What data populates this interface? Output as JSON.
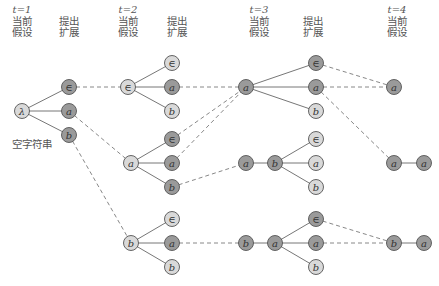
{
  "colors": {
    "node_light": "#d9d9d9",
    "node_dark": "#9a9a9a",
    "stroke": "#555555",
    "edge": "#777777",
    "dashed": "#888888"
  },
  "columns": [
    {
      "time_label": "t=1",
      "x": 22,
      "header": "当前\n假设",
      "header_line1": "当前",
      "header_line2": "假设"
    },
    {
      "x": 69,
      "header_line1": "提出",
      "header_line2": "扩展"
    },
    {
      "time_label": "t=2",
      "x": 128,
      "header_line1": "当前",
      "header_line2": "假设"
    },
    {
      "x": 172,
      "header_line1": "提出",
      "header_line2": "扩展"
    },
    {
      "time_label": "t=3",
      "x": 246,
      "header_line1": "当前",
      "header_line2": "假设"
    },
    {
      "x": 316,
      "header_line1": "提出",
      "header_line2": "扩展"
    },
    {
      "time_label": "t=4",
      "x": 394,
      "header_line1": "当前",
      "header_line2": "假设"
    }
  ],
  "annotation": "空字符串",
  "nodes": [
    {
      "id": "t1_root",
      "label": "λ",
      "x": 22,
      "y": 111,
      "shade": "light"
    },
    {
      "id": "t1_e",
      "label": "∈",
      "x": 69,
      "y": 87,
      "shade": "dark"
    },
    {
      "id": "t1_a",
      "label": "a",
      "x": 69,
      "y": 111,
      "shade": "dark"
    },
    {
      "id": "t1_b",
      "label": "b",
      "x": 69,
      "y": 135,
      "shade": "dark"
    },
    {
      "id": "t2A_root",
      "label": "∈",
      "x": 128,
      "y": 87,
      "shade": "light"
    },
    {
      "id": "t2A_e",
      "label": "∈",
      "x": 172,
      "y": 63,
      "shade": "light"
    },
    {
      "id": "t2A_a",
      "label": "a",
      "x": 172,
      "y": 87,
      "shade": "dark"
    },
    {
      "id": "t2A_b",
      "label": "b",
      "x": 172,
      "y": 111,
      "shade": "light"
    },
    {
      "id": "t2B_root",
      "label": "a",
      "x": 131,
      "y": 163,
      "shade": "light"
    },
    {
      "id": "t2B_e",
      "label": "∈",
      "x": 172,
      "y": 139,
      "shade": "dark"
    },
    {
      "id": "t2B_a",
      "label": "a",
      "x": 172,
      "y": 163,
      "shade": "dark"
    },
    {
      "id": "t2B_b",
      "label": "b",
      "x": 172,
      "y": 187,
      "shade": "dark"
    },
    {
      "id": "t2C_root",
      "label": "b",
      "x": 131,
      "y": 243,
      "shade": "light"
    },
    {
      "id": "t2C_e",
      "label": "∈",
      "x": 172,
      "y": 219,
      "shade": "light"
    },
    {
      "id": "t2C_a",
      "label": "a",
      "x": 172,
      "y": 243,
      "shade": "dark"
    },
    {
      "id": "t2C_b",
      "label": "b",
      "x": 172,
      "y": 267,
      "shade": "light"
    },
    {
      "id": "t3A_root",
      "label": "a",
      "x": 246,
      "y": 87,
      "shade": "dark"
    },
    {
      "id": "t3A_e",
      "label": "∈",
      "x": 316,
      "y": 63,
      "shade": "dark"
    },
    {
      "id": "t3A_a",
      "label": "a",
      "x": 316,
      "y": 87,
      "shade": "dark"
    },
    {
      "id": "t3A_b",
      "label": "b",
      "x": 316,
      "y": 111,
      "shade": "light"
    },
    {
      "id": "t3B_root1",
      "label": "a",
      "x": 246,
      "y": 163,
      "shade": "dark"
    },
    {
      "id": "t3B_root2",
      "label": "b",
      "x": 275,
      "y": 163,
      "shade": "dark"
    },
    {
      "id": "t3B_e",
      "label": "∈",
      "x": 316,
      "y": 139,
      "shade": "light"
    },
    {
      "id": "t3B_a",
      "label": "a",
      "x": 316,
      "y": 163,
      "shade": "light"
    },
    {
      "id": "t3B_b",
      "label": "b",
      "x": 316,
      "y": 187,
      "shade": "light"
    },
    {
      "id": "t3C_root1",
      "label": "b",
      "x": 246,
      "y": 243,
      "shade": "dark"
    },
    {
      "id": "t3C_root2",
      "label": "a",
      "x": 275,
      "y": 243,
      "shade": "dark"
    },
    {
      "id": "t3C_e",
      "label": "∈",
      "x": 316,
      "y": 219,
      "shade": "dark"
    },
    {
      "id": "t3C_a",
      "label": "a",
      "x": 316,
      "y": 243,
      "shade": "dark"
    },
    {
      "id": "t3C_b",
      "label": "b",
      "x": 316,
      "y": 267,
      "shade": "light"
    },
    {
      "id": "t4A",
      "label": "a",
      "x": 394,
      "y": 87,
      "shade": "dark"
    },
    {
      "id": "t4B1",
      "label": "a",
      "x": 394,
      "y": 163,
      "shade": "dark"
    },
    {
      "id": "t4B2",
      "label": "a",
      "x": 424,
      "y": 163,
      "shade": "dark"
    },
    {
      "id": "t4C1",
      "label": "b",
      "x": 394,
      "y": 243,
      "shade": "dark"
    },
    {
      "id": "t4C2",
      "label": "a",
      "x": 424,
      "y": 243,
      "shade": "dark"
    }
  ],
  "solid_edges": [
    [
      "t1_root",
      "t1_e"
    ],
    [
      "t1_root",
      "t1_a"
    ],
    [
      "t1_root",
      "t1_b"
    ],
    [
      "t2A_root",
      "t2A_e"
    ],
    [
      "t2A_root",
      "t2A_a"
    ],
    [
      "t2A_root",
      "t2A_b"
    ],
    [
      "t2B_root",
      "t2B_e"
    ],
    [
      "t2B_root",
      "t2B_a"
    ],
    [
      "t2B_root",
      "t2B_b"
    ],
    [
      "t2C_root",
      "t2C_e"
    ],
    [
      "t2C_root",
      "t2C_a"
    ],
    [
      "t2C_root",
      "t2C_b"
    ],
    [
      "t3A_root",
      "t3A_e"
    ],
    [
      "t3A_root",
      "t3A_a"
    ],
    [
      "t3A_root",
      "t3A_b"
    ],
    [
      "t3B_root1",
      "t3B_root2"
    ],
    [
      "t3B_root2",
      "t3B_e"
    ],
    [
      "t3B_root2",
      "t3B_a"
    ],
    [
      "t3B_root2",
      "t3B_b"
    ],
    [
      "t3C_root1",
      "t3C_root2"
    ],
    [
      "t3C_root2",
      "t3C_e"
    ],
    [
      "t3C_root2",
      "t3C_a"
    ],
    [
      "t3C_root2",
      "t3C_b"
    ],
    [
      "t4B1",
      "t4B2"
    ],
    [
      "t4C1",
      "t4C2"
    ]
  ],
  "dashed_edges": [
    [
      "t1_e",
      "t2A_root"
    ],
    [
      "t1_a",
      "t2B_root"
    ],
    [
      "t1_b",
      "t2C_root"
    ],
    [
      "t2A_a",
      "t3A_root"
    ],
    [
      "t2B_e",
      "t3A_root"
    ],
    [
      "t2B_a",
      "t3A_root"
    ],
    [
      "t2B_b",
      "t3B_root1"
    ],
    [
      "t2C_a",
      "t3C_root1"
    ],
    [
      "t3A_e",
      "t4A"
    ],
    [
      "t3A_a",
      "t4A"
    ],
    [
      "t3A_a",
      "t4B1"
    ],
    [
      "t3C_e",
      "t4C1"
    ],
    [
      "t3C_a",
      "t4C1"
    ]
  ]
}
